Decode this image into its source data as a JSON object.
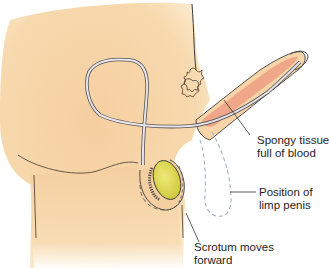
{
  "figure": {
    "colors": {
      "skin": "#f5d3a6",
      "skin_light": "#fbe8c4",
      "erectile_tissue": "#ef9e82",
      "testis": "#e2df5a",
      "outline": "#4a4a4a",
      "urethra": "#c9c2cf",
      "dashed_outline": "#9fb2c6",
      "hair": "#5a4a3a"
    }
  },
  "labels": [
    {
      "id": "spongy-tissue",
      "lines": [
        "Spongy tissue",
        "full of blood"
      ]
    },
    {
      "id": "limp-position",
      "lines": [
        "Position of",
        "limp penis"
      ]
    },
    {
      "id": "scrotum",
      "lines": [
        "Scrotum moves",
        "forward"
      ]
    }
  ]
}
